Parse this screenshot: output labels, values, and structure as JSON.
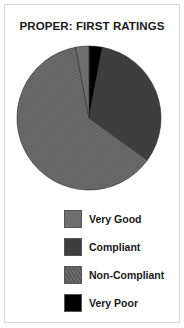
{
  "title": "PROPER:  FIRST RATINGS",
  "chart_data": {
    "type": "pie",
    "title": "PROPER:  FIRST RATINGS",
    "categories": [
      "Very Good",
      "Compliant",
      "Non-Compliant",
      "Very Poor"
    ],
    "values": [
      3,
      32,
      62,
      3
    ],
    "unit": "%",
    "colors": [
      "#6e6e6e",
      "#3e3e3e",
      "#686868",
      "#000000"
    ],
    "start_angle_deg": 0,
    "direction": "clockwise",
    "slice_order_from_top": [
      "Very Poor",
      "Compliant",
      "Non-Compliant",
      "Very Good"
    ],
    "legend_position": "bottom"
  },
  "legend": [
    {
      "label": "Very Good",
      "color": "#6e6e6e",
      "pattern": "solid"
    },
    {
      "label": "Compliant",
      "color": "#3e3e3e",
      "pattern": "solid"
    },
    {
      "label": "Non-Compliant",
      "color": "#686868",
      "pattern": "hatched"
    },
    {
      "label": "Very Poor",
      "color": "#000000",
      "pattern": "solid"
    }
  ]
}
